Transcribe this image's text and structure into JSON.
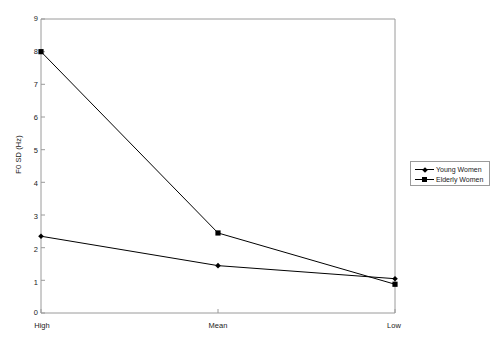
{
  "chart_data": {
    "type": "line",
    "title": "",
    "xlabel": "",
    "ylabel": "F0 SD (Hz)",
    "categories": [
      "High",
      "Mean",
      "Low"
    ],
    "ylim": [
      0,
      9
    ],
    "yticks": [
      0,
      1,
      2,
      3,
      4,
      5,
      6,
      7,
      8,
      9
    ],
    "grid": false,
    "legend_position": "right",
    "series": [
      {
        "name": "Young Women",
        "marker": "diamond",
        "color": "#000000",
        "values": [
          2.35,
          1.45,
          1.05
        ]
      },
      {
        "name": "Elderly Women",
        "marker": "square",
        "color": "#000000",
        "values": [
          8.0,
          2.45,
          0.88
        ]
      }
    ]
  },
  "axis": {
    "y_label": "F0 SD (Hz)",
    "y_ticks": [
      "9",
      "8",
      "7",
      "6",
      "5",
      "4",
      "3",
      "2",
      "1",
      "0"
    ],
    "x_ticks": [
      "High",
      "Mean",
      "Low"
    ]
  },
  "legend": {
    "items": [
      {
        "label": "Young Women"
      },
      {
        "label": "Elderly Women"
      }
    ]
  },
  "colors": {
    "line": "#000000",
    "frame": "#9a9a9a",
    "text": "#1a1a1a",
    "background": "#ffffff"
  }
}
